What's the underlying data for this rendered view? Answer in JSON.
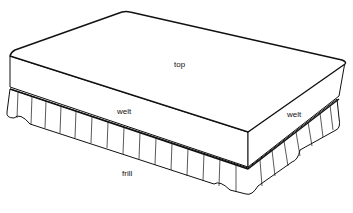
{
  "diagram": {
    "labels": {
      "top": "top",
      "welt_front": "welt",
      "welt_side": "welt",
      "frill": "frill"
    },
    "colors": {
      "line": "#111111",
      "fill": "#ffffff"
    }
  }
}
